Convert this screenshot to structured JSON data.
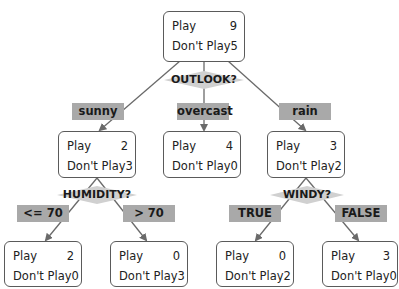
{
  "tree": {
    "root": {
      "play_label": "Play",
      "play": "9",
      "dont_label": "Don't Play",
      "dont": "5",
      "split": "OUTLOOK?"
    },
    "branches": [
      {
        "edge": "sunny",
        "play_label": "Play",
        "play": "2",
        "dont_label": "Don't Play",
        "dont": "3",
        "split": "HUMIDITY?",
        "children": [
          {
            "edge": "<= 70",
            "play_label": "Play",
            "play": "2",
            "dont_label": "Don't Play",
            "dont": "0"
          },
          {
            "edge": "> 70",
            "play_label": "Play",
            "play": "0",
            "dont_label": "Don't Play",
            "dont": "3"
          }
        ]
      },
      {
        "edge": "overcast",
        "play_label": "Play",
        "play": "4",
        "dont_label": "Don't Play",
        "dont": "0"
      },
      {
        "edge": "rain",
        "play_label": "Play",
        "play": "3",
        "dont_label": "Don't Play",
        "dont": "2",
        "split": "WINDY?",
        "children": [
          {
            "edge": "TRUE",
            "play_label": "Play",
            "play": "0",
            "dont_label": "Don't Play",
            "dont": "2"
          },
          {
            "edge": "FALSE",
            "play_label": "Play",
            "play": "3",
            "dont_label": "Don't Play",
            "dont": "0"
          }
        ]
      }
    ]
  },
  "colors": {
    "edge_label_bg": "#a9a9a9",
    "diamond_fill": "#d0d0d0",
    "node_border": "#5a5a5a",
    "line": "#6a6a6a"
  }
}
